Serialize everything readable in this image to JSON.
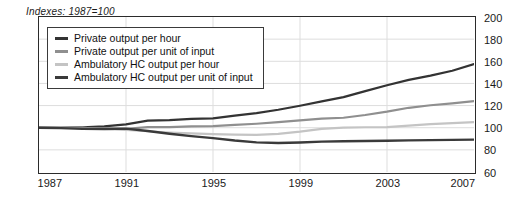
{
  "chart_data": {
    "type": "line",
    "title": "Indexes: 1987=100",
    "xlabel": "",
    "ylabel": "",
    "xlim": [
      1987,
      2007
    ],
    "ylim": [
      60,
      200
    ],
    "ytick_labels": [
      "200",
      "180",
      "160",
      "140",
      "120",
      "100",
      "80",
      "60"
    ],
    "ytick_values": [
      200,
      180,
      160,
      140,
      120,
      100,
      80,
      60
    ],
    "xtick_labels": [
      "1987",
      "1991",
      "1995",
      "1999",
      "2003",
      "2007"
    ],
    "xtick_values": [
      1987,
      1991,
      1995,
      1999,
      2003,
      2007
    ],
    "grid": true,
    "legend_position": "upper-left",
    "x": [
      1987,
      1988,
      1989,
      1990,
      1991,
      1992,
      1993,
      1994,
      1995,
      1996,
      1997,
      1998,
      1999,
      2000,
      2001,
      2002,
      2003,
      2004,
      2005,
      2006,
      2007
    ],
    "series": [
      {
        "name": "Private output per hour",
        "color": "#333333",
        "width": 2.2,
        "values": [
          100,
          100.6,
          100.3,
          101.3,
          103.0,
          106.4,
          106.8,
          107.9,
          108.5,
          111.0,
          113.2,
          116.2,
          119.8,
          123.8,
          127.6,
          133.0,
          138.4,
          143.2,
          147.0,
          151.5,
          157.5
        ]
      },
      {
        "name": "Private output per unit of input",
        "color": "#8f8f8f",
        "width": 2.2,
        "values": [
          100,
          100.2,
          99.6,
          99.3,
          99.0,
          100.5,
          100.6,
          101.3,
          101.4,
          102.5,
          103.6,
          105.0,
          106.6,
          108.2,
          109.0,
          111.5,
          114.5,
          118.0,
          120.3,
          122.0,
          124.0
        ]
      },
      {
        "name": "Ambulatory HC output per hour",
        "color": "#c4c4c4",
        "width": 2.2,
        "values": [
          100,
          100.3,
          99.8,
          99.0,
          98.0,
          96.8,
          95.6,
          94.8,
          94.2,
          93.8,
          93.6,
          94.4,
          96.4,
          99.0,
          100.0,
          100.4,
          100.6,
          101.8,
          103.2,
          104.2,
          105.0
        ]
      },
      {
        "name": "Ambulatory HC output per unit of input",
        "color": "#3a3a3a",
        "width": 2.4,
        "values": [
          100,
          99.6,
          99.0,
          98.8,
          99.2,
          97.0,
          94.6,
          92.4,
          90.6,
          88.4,
          86.8,
          86.2,
          86.6,
          87.4,
          87.8,
          88.0,
          88.2,
          88.6,
          88.8,
          89.0,
          89.2
        ]
      }
    ]
  }
}
